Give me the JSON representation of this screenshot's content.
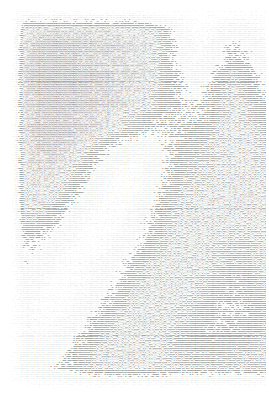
{
  "artwork": {
    "title": "ASCII Art Image",
    "type": "ascii-art-halftone",
    "description": "Monospace character-density rendering of a photographic image",
    "background_color": "#ffffff",
    "ink_color": "#2b2b2b",
    "canvas": {
      "width": 269,
      "height": 395
    },
    "content_box": {
      "left": 12,
      "top": 8,
      "width": 254,
      "height": 378
    },
    "grid": {
      "columns": 250,
      "rows": 190,
      "char_width": 1.016,
      "line_height": 1.98
    },
    "ramp": "@%#*+=-:. ",
    "ramp_note": "Index 0 is darkest (densest glyph), last index is lightest (space)",
    "luminance_map": {
      "note": "Coarse luminance grid sampled from the image; 0 = black (dense glyphs), 100 = white (spaces). Bilinearly upsampled to the full character grid at render time.",
      "cols": 26,
      "rows": 20,
      "values": [
        [
          100,
          100,
          100,
          100,
          100,
          100,
          100,
          100,
          100,
          100,
          100,
          100,
          100,
          100,
          100,
          100,
          100,
          100,
          100,
          100,
          100,
          100,
          100,
          100,
          100,
          100
        ],
        [
          100,
          30,
          24,
          22,
          22,
          24,
          24,
          26,
          26,
          28,
          30,
          34,
          40,
          62,
          84,
          92,
          88,
          80,
          72,
          76,
          86,
          90,
          78,
          70,
          74,
          88
        ],
        [
          100,
          26,
          20,
          18,
          18,
          20,
          22,
          24,
          24,
          26,
          28,
          32,
          40,
          58,
          80,
          90,
          84,
          72,
          60,
          64,
          80,
          88,
          72,
          60,
          64,
          82
        ],
        [
          100,
          24,
          18,
          16,
          16,
          18,
          20,
          22,
          24,
          26,
          28,
          32,
          42,
          56,
          72,
          82,
          74,
          58,
          46,
          52,
          70,
          80,
          62,
          50,
          56,
          74
        ],
        [
          100,
          24,
          18,
          16,
          16,
          18,
          20,
          22,
          24,
          26,
          30,
          34,
          44,
          54,
          64,
          70,
          60,
          46,
          38,
          44,
          58,
          68,
          54,
          44,
          50,
          66
        ],
        [
          100,
          26,
          20,
          18,
          18,
          20,
          22,
          24,
          26,
          30,
          34,
          40,
          48,
          56,
          62,
          64,
          54,
          42,
          36,
          40,
          50,
          58,
          48,
          40,
          46,
          60
        ],
        [
          100,
          28,
          22,
          20,
          20,
          22,
          26,
          30,
          36,
          44,
          54,
          62,
          66,
          62,
          58,
          56,
          48,
          40,
          36,
          38,
          44,
          50,
          44,
          38,
          42,
          54
        ],
        [
          100,
          30,
          24,
          22,
          24,
          30,
          40,
          54,
          68,
          78,
          84,
          82,
          72,
          60,
          52,
          48,
          42,
          38,
          36,
          36,
          40,
          44,
          40,
          36,
          40,
          50
        ],
        [
          100,
          32,
          26,
          26,
          30,
          40,
          56,
          72,
          84,
          90,
          90,
          84,
          70,
          56,
          46,
          42,
          38,
          36,
          34,
          34,
          36,
          40,
          38,
          34,
          38,
          48
        ],
        [
          100,
          34,
          30,
          32,
          40,
          54,
          70,
          84,
          92,
          94,
          90,
          80,
          64,
          50,
          42,
          38,
          36,
          34,
          32,
          32,
          34,
          36,
          34,
          32,
          36,
          46
        ],
        [
          100,
          40,
          38,
          44,
          56,
          72,
          84,
          92,
          94,
          92,
          84,
          72,
          56,
          44,
          38,
          36,
          34,
          34,
          34,
          34,
          34,
          34,
          32,
          32,
          36,
          46
        ],
        [
          100,
          52,
          52,
          60,
          72,
          84,
          92,
          94,
          92,
          86,
          76,
          62,
          48,
          40,
          36,
          34,
          34,
          36,
          38,
          38,
          36,
          34,
          32,
          32,
          36,
          48
        ],
        [
          100,
          64,
          66,
          74,
          84,
          92,
          94,
          92,
          86,
          76,
          64,
          52,
          42,
          36,
          34,
          34,
          36,
          40,
          44,
          44,
          40,
          36,
          34,
          34,
          38,
          50
        ],
        [
          100,
          74,
          78,
          86,
          92,
          94,
          92,
          86,
          76,
          64,
          52,
          42,
          36,
          34,
          34,
          36,
          40,
          46,
          50,
          50,
          44,
          38,
          36,
          36,
          42,
          54
        ],
        [
          100,
          80,
          86,
          92,
          94,
          92,
          86,
          76,
          64,
          52,
          42,
          36,
          34,
          34,
          36,
          40,
          46,
          52,
          56,
          54,
          48,
          42,
          38,
          40,
          46,
          58
        ],
        [
          100,
          84,
          90,
          94,
          92,
          86,
          76,
          64,
          52,
          42,
          36,
          34,
          34,
          36,
          40,
          46,
          52,
          58,
          60,
          58,
          50,
          44,
          42,
          44,
          50,
          62
        ],
        [
          100,
          86,
          90,
          90,
          84,
          74,
          62,
          50,
          42,
          36,
          34,
          34,
          36,
          40,
          46,
          52,
          56,
          58,
          56,
          52,
          46,
          42,
          42,
          46,
          52,
          64
        ],
        [
          100,
          84,
          84,
          80,
          72,
          60,
          50,
          42,
          36,
          34,
          34,
          36,
          40,
          44,
          48,
          50,
          50,
          48,
          46,
          44,
          42,
          40,
          42,
          46,
          52,
          64
        ],
        [
          100,
          78,
          74,
          68,
          60,
          52,
          44,
          38,
          36,
          34,
          34,
          36,
          38,
          40,
          42,
          42,
          42,
          42,
          42,
          42,
          42,
          42,
          44,
          48,
          54,
          66
        ],
        [
          100,
          100,
          100,
          100,
          100,
          100,
          100,
          100,
          100,
          100,
          100,
          100,
          100,
          100,
          100,
          100,
          100,
          100,
          100,
          100,
          100,
          100,
          100,
          100,
          100,
          100
        ]
      ]
    },
    "texture": {
      "note": "Per-character pseudo-random dither amplitude, reproduces the speckled scanline look of the source",
      "amplitude": 17,
      "row_jitter": 7,
      "seed": 20250514
    }
  }
}
